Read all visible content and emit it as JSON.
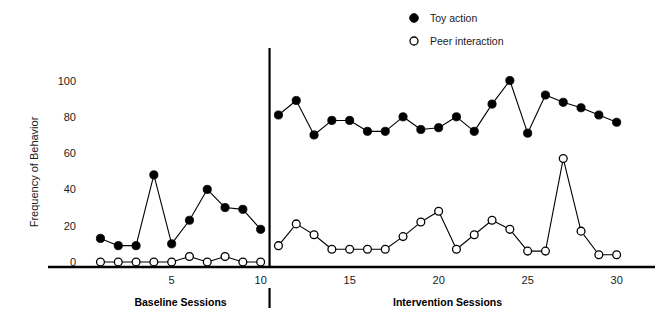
{
  "chart_data": {
    "type": "line",
    "title": "",
    "xlabel": "",
    "ylabel": "Frequency of Behavior",
    "ylim": [
      0,
      108
    ],
    "xlim": [
      0.3,
      31.2
    ],
    "ytick_values": [
      0,
      20,
      40,
      60,
      80,
      100
    ],
    "ytick_labels": [
      "0",
      "20",
      "40",
      "60",
      "80",
      "100"
    ],
    "xtick_values": [
      5,
      10,
      15,
      20,
      25,
      30
    ],
    "xtick_labels": [
      "5",
      "10",
      "15",
      "20",
      "25",
      "30"
    ],
    "grid": false,
    "legend_position": "top-center-right",
    "phase_divider_x": 10.5,
    "phases": [
      {
        "name": "Baseline Sessions",
        "start": 1,
        "end": 10
      },
      {
        "name": "Intervention Sessions",
        "start": 11,
        "end": 30
      }
    ],
    "series": [
      {
        "name": "Toy action",
        "marker": "filled-circle",
        "color": "#000000",
        "segments": [
          {
            "phase": "Baseline Sessions",
            "x": [
              1,
              2,
              3,
              4,
              5,
              6,
              7,
              8,
              9,
              10
            ],
            "values": [
              13,
              9,
              9,
              48,
              10,
              23,
              40,
              30,
              29,
              18
            ]
          },
          {
            "phase": "Intervention Sessions",
            "x": [
              11,
              12,
              13,
              14,
              15,
              16,
              17,
              18,
              19,
              20,
              21,
              22,
              23,
              24,
              25,
              26,
              27,
              28,
              29,
              30
            ],
            "values": [
              81,
              89,
              70,
              78,
              78,
              72,
              72,
              80,
              73,
              74,
              80,
              72,
              87,
              100,
              71,
              92,
              88,
              85,
              81,
              77
            ]
          }
        ]
      },
      {
        "name": "Peer interaction",
        "marker": "open-circle",
        "color": "#000000",
        "segments": [
          {
            "phase": "Baseline Sessions",
            "x": [
              1,
              2,
              3,
              4,
              5,
              6,
              7,
              8,
              9,
              10
            ],
            "values": [
              0,
              0,
              0,
              0,
              0,
              3,
              0,
              3,
              0,
              0
            ]
          },
          {
            "phase": "Intervention Sessions",
            "x": [
              11,
              12,
              13,
              14,
              15,
              16,
              17,
              18,
              19,
              20,
              21,
              22,
              23,
              24,
              25,
              26,
              27,
              28,
              29,
              30
            ],
            "values": [
              9,
              21,
              15,
              7,
              7,
              7,
              7,
              14,
              22,
              28,
              7,
              15,
              23,
              18,
              6,
              6,
              57,
              17,
              4,
              4
            ]
          }
        ]
      }
    ]
  },
  "legend": {
    "items": [
      {
        "label": "Toy action",
        "marker": "filled-circle"
      },
      {
        "label": "Peer interaction",
        "marker": "open-circle"
      }
    ]
  },
  "axis": {
    "y_title": "Frequency of Behavior"
  }
}
